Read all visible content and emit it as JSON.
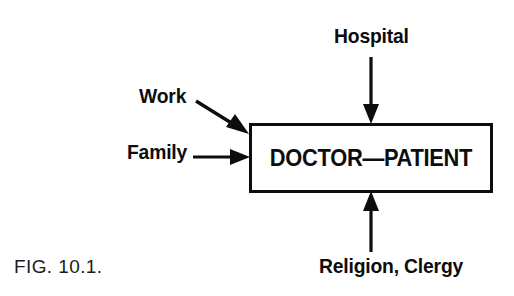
{
  "figure": {
    "caption": "FIG. 10.1.",
    "center_node": {
      "label": "DOCTOR—PATIENT"
    },
    "influences": [
      {
        "id": "hospital",
        "label": "Hospital",
        "position": "top",
        "arrow_direction": "down"
      },
      {
        "id": "work",
        "label": "Work",
        "position": "upper-left",
        "arrow_direction": "diagonal-down-right"
      },
      {
        "id": "family",
        "label": "Family",
        "position": "left",
        "arrow_direction": "right"
      },
      {
        "id": "religion",
        "label": "Religion, Clergy",
        "position": "bottom",
        "arrow_direction": "up"
      }
    ],
    "colors": {
      "ink": "#0d0d0d",
      "background": "#ffffff"
    }
  }
}
